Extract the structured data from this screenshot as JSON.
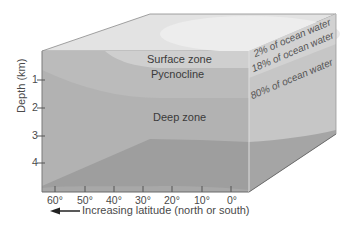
{
  "diagram": {
    "zones": {
      "surface": "Surface zone",
      "pycnocline": "Pycnocline",
      "deep": "Deep zone"
    },
    "side_labels": {
      "surface": "2% of ocean water",
      "pycnocline": "18% of ocean water",
      "deep": "80% of ocean water"
    },
    "y_axis": {
      "label": "Depth (km)",
      "ticks": [
        "1",
        "2",
        "3",
        "4"
      ]
    },
    "x_axis": {
      "label": "Increasing latitude (north or south)",
      "ticks": [
        "60°",
        "50°",
        "40°",
        "30°",
        "20°",
        "10°",
        "0°"
      ],
      "arrow": "left-arrow-icon"
    },
    "colors": {
      "surface": "#d9d9d9",
      "pycnocline": "#bdbdbd",
      "deep": "#b0b0b0",
      "bottom_water": "#9a9a9a",
      "top_face": "#e4e4e4",
      "right_face": "#c9c9c9",
      "edge": "#8a8a8a"
    }
  }
}
